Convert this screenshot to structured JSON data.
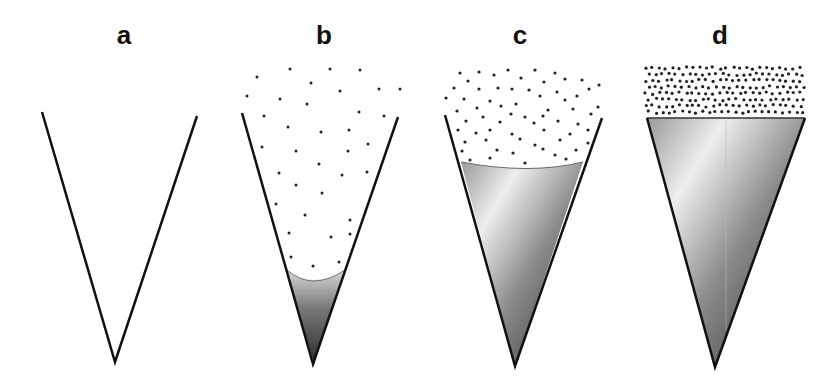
{
  "figure": {
    "panels": [
      {
        "label": "a",
        "state": "empty cone",
        "fill_level": 0,
        "particle_density": "none"
      },
      {
        "label": "b",
        "state": "small liquid volume at tip with sparse particles above",
        "fill_level": 0.3,
        "particle_density": "sparse"
      },
      {
        "label": "c",
        "state": "cone mostly filled with liquid, moderate particles above",
        "fill_level": 0.8,
        "particle_density": "moderate"
      },
      {
        "label": "d",
        "state": "cone completely filled, dense particle layer on flat surface",
        "fill_level": 1.0,
        "particle_density": "dense"
      }
    ],
    "colors": {
      "outline": "#111111",
      "liquid_dark": "#3a3a3a",
      "liquid_light": "#e8e8e8",
      "particle": "#222222",
      "background": "#ffffff"
    }
  }
}
